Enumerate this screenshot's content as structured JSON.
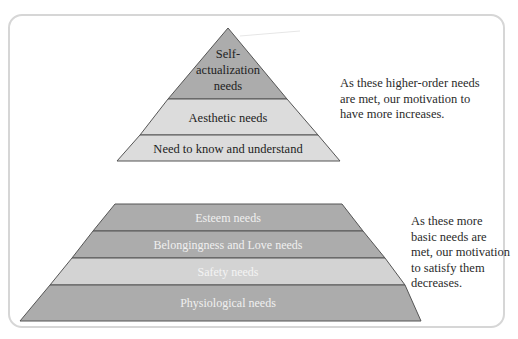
{
  "diagram": {
    "colors": {
      "frame": "#d6d6d6",
      "outline": "#555555",
      "dark_layer": "#acacac",
      "light_layer": "#dcdcdc",
      "safety_layer": "#d3d3d3",
      "dark_text": "#222222",
      "light_text": "#f0f0f0"
    },
    "upper_pyramid": {
      "layers": [
        {
          "label_line1": "Self-",
          "label_line2": "actualization",
          "label_line3": "needs"
        },
        {
          "label": "Aesthetic needs"
        },
        {
          "label": "Need to know and understand"
        }
      ]
    },
    "lower_pyramid": {
      "layers": [
        {
          "label": "Esteem needs"
        },
        {
          "label": "Belongingness and Love needs"
        },
        {
          "label": "Safety needs"
        },
        {
          "label": "Physiological needs"
        }
      ]
    },
    "notes": {
      "higher": "As these higher-order needs are met, our motivation to have more increases.",
      "basic": "As these more basic needs are met, our motivation to satisfy them decreases."
    }
  }
}
